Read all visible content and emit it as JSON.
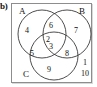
{
  "figure": {
    "part_label": "b)",
    "type": "three-set-venn-diagram",
    "sets": [
      {
        "key": "A",
        "label": "A",
        "position": "top-left"
      },
      {
        "key": "B",
        "label": "B",
        "position": "top-right"
      },
      {
        "key": "C",
        "label": "C",
        "position": "bottom-left"
      }
    ],
    "regions": [
      {
        "id": "a-only",
        "label": "A only",
        "value": "4",
        "x": 27,
        "y": 31
      },
      {
        "id": "b-only",
        "label": "B only",
        "value": "7",
        "x": 76,
        "y": 31
      },
      {
        "id": "c-only",
        "label": "C only",
        "value": "9",
        "x": 49,
        "y": 70
      },
      {
        "id": "a-and-b",
        "label": "A and B",
        "value": "6",
        "x": 51,
        "y": 26
      },
      {
        "id": "a-and-c",
        "label": "A and C",
        "value": "5",
        "x": 32,
        "y": 54
      },
      {
        "id": "b-and-c",
        "label": "B and C",
        "value": "8",
        "x": 67,
        "y": 54
      },
      {
        "id": "a-b-c-upper",
        "label": "A and B and C",
        "value": "2",
        "x": 48,
        "y": 40
      },
      {
        "id": "a-b-c-lower",
        "label": "A and B and C",
        "value": "3",
        "x": 51,
        "y": 47
      },
      {
        "id": "outside-1",
        "label": "outside all sets",
        "value": "1",
        "x": 85,
        "y": 63
      },
      {
        "id": "outside-2",
        "label": "outside all sets",
        "value": "10",
        "x": 85,
        "y": 74
      }
    ],
    "colors": {
      "circle_stroke": "#3a3a3a",
      "frame_stroke": "#8d8d8d",
      "text": "#111111",
      "background": "#ffffff"
    }
  }
}
